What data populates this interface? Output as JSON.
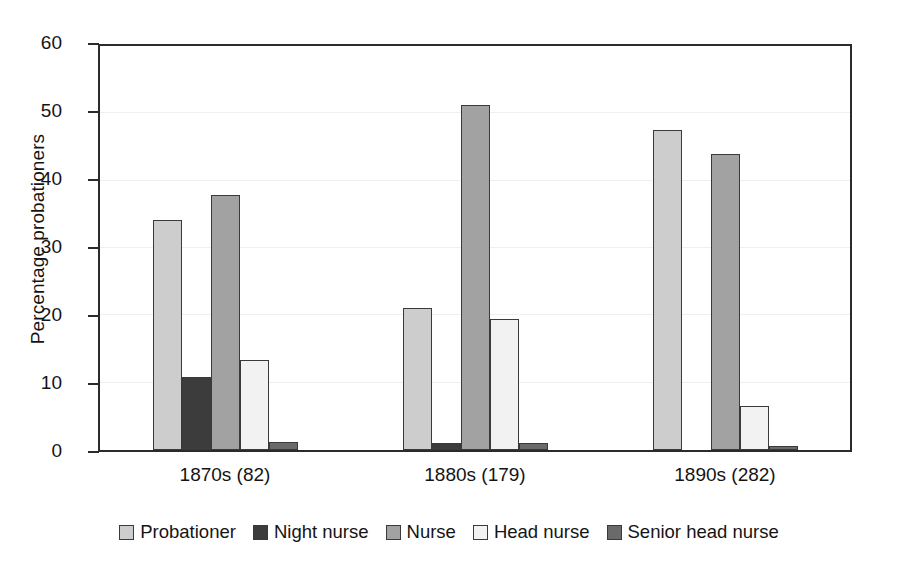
{
  "chart_data": {
    "type": "bar",
    "title": "",
    "subtitle": "",
    "xlabel": "",
    "ylabel": "Percentage probationers",
    "ylim": [
      0,
      60
    ],
    "yticks": [
      0,
      10,
      20,
      30,
      40,
      50,
      60
    ],
    "ytick_labels": [
      "0",
      "10",
      "20",
      "30",
      "40",
      "50",
      "60"
    ],
    "grid": "horizontal",
    "legend_position": "bottom",
    "categories": [
      "1870s (82)",
      "1880s (179)",
      "1890s (282)"
    ],
    "series": [
      {
        "name": "Probationer",
        "color": "#cdcdcd",
        "values": [
          34.2,
          21.1,
          47.5
        ]
      },
      {
        "name": "Night nurse",
        "color": "#3c3c3c",
        "values": [
          10.9,
          1.0,
          0.0
        ]
      },
      {
        "name": "Nurse",
        "color": "#a2a2a2",
        "values": [
          37.8,
          51.3,
          44.0
        ]
      },
      {
        "name": "Head nurse",
        "color": "#f2f2f2",
        "values": [
          13.4,
          19.4,
          6.5
        ]
      },
      {
        "name": "Senior head nurse",
        "color": "#6a6a6a",
        "values": [
          1.2,
          1.1,
          0.6
        ]
      }
    ]
  },
  "axis": {
    "y_title": "Percentage probationers"
  },
  "legend": {
    "items": [
      {
        "label": "Probationer"
      },
      {
        "label": "Night nurse"
      },
      {
        "label": "Nurse"
      },
      {
        "label": "Head nurse"
      },
      {
        "label": "Senior head nurse"
      }
    ]
  },
  "style": {
    "axis_color": "#2b2b2b",
    "grid_color": "#efefef",
    "text_color": "#141414",
    "background": "#ffffff",
    "bar_border": "#3a3a3a"
  }
}
